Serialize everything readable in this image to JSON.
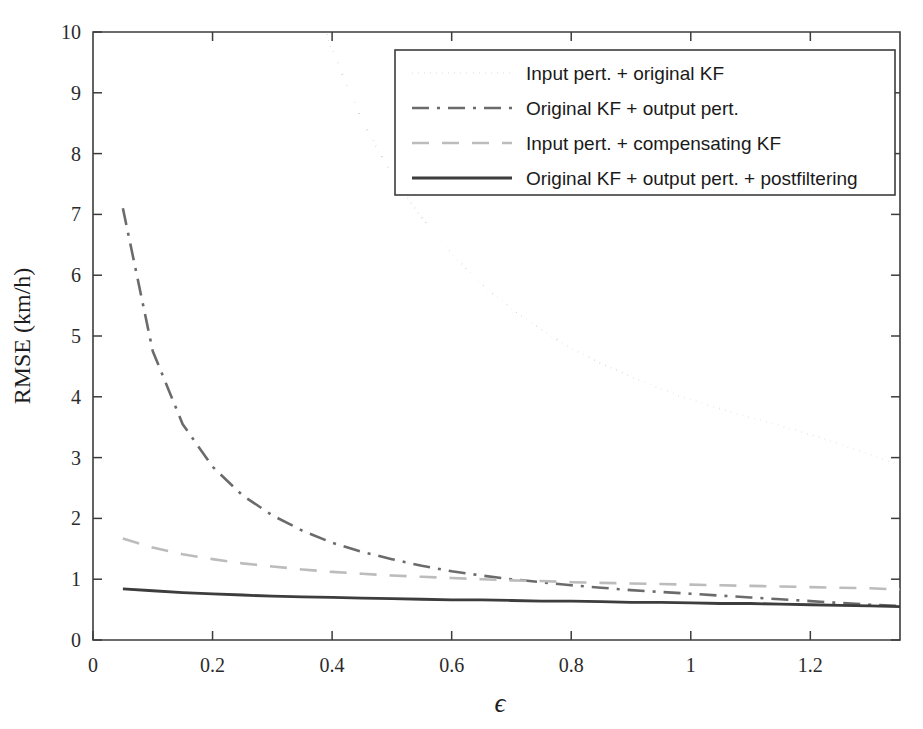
{
  "chart_data": {
    "type": "line",
    "title": "",
    "xlabel": "ϵ",
    "ylabel": "RMSE (km/h)",
    "xlim": [
      0,
      1.35
    ],
    "ylim": [
      0,
      10
    ],
    "xticks": [
      0,
      0.2,
      0.4,
      0.6,
      0.8,
      1,
      1.2
    ],
    "xticklabels": [
      "0",
      "0.2",
      "0.4",
      "0.6",
      "0.8",
      "1",
      "1.2"
    ],
    "yticks": [
      0,
      1,
      2,
      3,
      4,
      5,
      6,
      7,
      8,
      9,
      10
    ],
    "yticklabels": [
      "0",
      "1",
      "2",
      "3",
      "4",
      "5",
      "6",
      "7",
      "8",
      "9",
      "10"
    ],
    "grid": false,
    "legend_position": "upper right",
    "x": [
      0.05,
      0.1,
      0.15,
      0.2,
      0.25,
      0.3,
      0.35,
      0.4,
      0.45,
      0.5,
      0.55,
      0.6,
      0.65,
      0.7,
      0.75,
      0.8,
      0.85,
      0.9,
      0.95,
      1.0,
      1.05,
      1.1,
      1.15,
      1.2,
      1.25,
      1.3,
      1.35
    ],
    "series": [
      {
        "name": "Input pert. + original KF",
        "style": "dotted",
        "color": "#555555",
        "width": 2.0,
        "values": [
          62.0,
          38.0,
          26.5,
          20.0,
          16.0,
          13.2,
          11.2,
          9.7,
          8.55,
          7.65,
          6.95,
          6.35,
          5.85,
          5.45,
          5.1,
          4.8,
          4.55,
          4.33,
          4.13,
          3.95,
          3.8,
          3.66,
          3.52,
          3.38,
          3.22,
          3.05,
          2.88
        ]
      },
      {
        "name": "Original KF + output pert.",
        "style": "dashdot",
        "color": "#6b6b6b",
        "width": 2.6,
        "values": [
          7.1,
          4.75,
          3.55,
          2.85,
          2.38,
          2.05,
          1.8,
          1.6,
          1.45,
          1.33,
          1.22,
          1.13,
          1.06,
          1.0,
          0.95,
          0.9,
          0.86,
          0.82,
          0.79,
          0.76,
          0.73,
          0.7,
          0.67,
          0.64,
          0.61,
          0.58,
          0.56
        ]
      },
      {
        "name": "Input pert. + compensating KF",
        "style": "dashed",
        "color": "#bcbcbc",
        "width": 2.6,
        "values": [
          1.67,
          1.52,
          1.41,
          1.33,
          1.26,
          1.21,
          1.16,
          1.12,
          1.09,
          1.06,
          1.04,
          1.02,
          1.0,
          0.98,
          0.97,
          0.95,
          0.94,
          0.93,
          0.92,
          0.91,
          0.9,
          0.89,
          0.88,
          0.87,
          0.86,
          0.85,
          0.83
        ]
      },
      {
        "name": "Original KF + output pert. + postfiltering",
        "style": "solid",
        "color": "#3d3d3d",
        "width": 2.8,
        "values": [
          0.84,
          0.81,
          0.78,
          0.76,
          0.74,
          0.72,
          0.71,
          0.7,
          0.69,
          0.68,
          0.67,
          0.66,
          0.66,
          0.65,
          0.64,
          0.64,
          0.63,
          0.62,
          0.62,
          0.61,
          0.6,
          0.6,
          0.59,
          0.58,
          0.57,
          0.56,
          0.55
        ]
      }
    ]
  },
  "legend": {
    "entries": [
      {
        "label": "Input pert. + original KF"
      },
      {
        "label": "Original KF + output pert."
      },
      {
        "label": "Input pert. + compensating KF"
      },
      {
        "label": "Original KF + output pert. + postfiltering"
      }
    ]
  },
  "colors": {
    "axis": "#3c3c3c",
    "background": "#ffffff",
    "text": "#1d1d1d"
  }
}
